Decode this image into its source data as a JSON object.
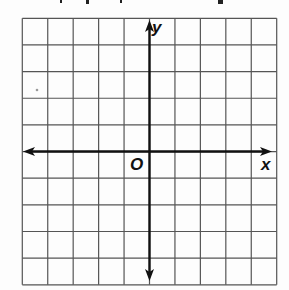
{
  "diagram": {
    "type": "coordinate-plane",
    "grid": {
      "columns": 10,
      "rows": 10,
      "left": 22.3,
      "top": 18.3,
      "cell_width": 25.44,
      "cell_height": 26.65,
      "line_color": "#555555",
      "line_width": 1.2
    },
    "axes": {
      "color": "#111111",
      "width": 2.4,
      "origin_col": 5,
      "origin_row": 5,
      "x_axis": {
        "from_x": 23,
        "to_x": 272,
        "label": "x"
      },
      "y_axis": {
        "from_y": 20,
        "to_y": 281,
        "label": "y"
      },
      "origin_label": "O"
    },
    "labels": {
      "x": "x",
      "y": "y",
      "origin": "O"
    }
  }
}
